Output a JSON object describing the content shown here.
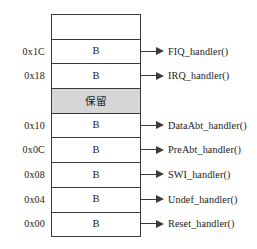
{
  "diagram": {
    "colors": {
      "border": "#3a3a3a",
      "reserved_fill": "#d6d6d6",
      "background": "#ffffff",
      "text": "#1a1a1a"
    },
    "rows": [
      {
        "address": "",
        "cell": "",
        "handler": "",
        "reserved": false,
        "has_arrow": false
      },
      {
        "address": "0x1C",
        "cell": "B",
        "handler": "FIQ_handler()",
        "reserved": false,
        "has_arrow": true
      },
      {
        "address": "0x18",
        "cell": "B",
        "handler": "IRQ_handler()",
        "reserved": false,
        "has_arrow": true
      },
      {
        "address": "",
        "cell": "保留",
        "handler": "",
        "reserved": true,
        "has_arrow": false
      },
      {
        "address": "0x10",
        "cell": "B",
        "handler": "DataAbt_handler()",
        "reserved": false,
        "has_arrow": true
      },
      {
        "address": "0x0C",
        "cell": "B",
        "handler": "PreAbt_handler()",
        "reserved": false,
        "has_arrow": true
      },
      {
        "address": "0x08",
        "cell": "B",
        "handler": "SWI_handler()",
        "reserved": false,
        "has_arrow": true
      },
      {
        "address": "0x04",
        "cell": "B",
        "handler": "Undef_handler()",
        "reserved": false,
        "has_arrow": true
      },
      {
        "address": "0x00",
        "cell": "B",
        "handler": "Reset_handler()",
        "reserved": false,
        "has_arrow": true
      }
    ]
  }
}
